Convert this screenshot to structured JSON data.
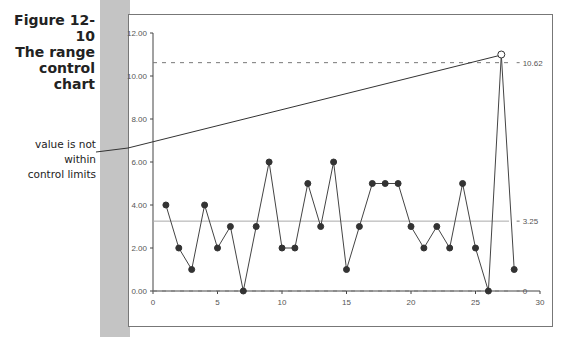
{
  "figure": {
    "caption_line1": "Figure 12-10",
    "caption_line2": "The range",
    "caption_line3": "control",
    "caption_line4": "chart",
    "annotation_line1": "value is not within",
    "annotation_line2": "control limits"
  },
  "chart_data": {
    "type": "line",
    "title": "The range control chart",
    "xlabel": "",
    "ylabel": "",
    "xlim": [
      0,
      30
    ],
    "ylim": [
      0,
      12
    ],
    "x_ticks": [
      "0",
      "5",
      "10",
      "15",
      "20",
      "25",
      "30"
    ],
    "y_ticks": [
      "0.00",
      "2.00",
      "4.00",
      "6.00",
      "8.00",
      "10.00",
      "12.00"
    ],
    "series": [
      {
        "name": "Range",
        "x": [
          1,
          2,
          3,
          4,
          5,
          6,
          7,
          8,
          9,
          10,
          11,
          12,
          13,
          14,
          15,
          16,
          17,
          18,
          19,
          20,
          21,
          22,
          23,
          24,
          25,
          26,
          27,
          28
        ],
        "values": [
          4,
          2,
          1,
          4,
          2,
          3,
          0,
          3,
          6,
          2,
          2,
          5,
          3,
          6,
          1,
          3,
          5,
          5,
          5,
          3,
          2,
          3,
          2,
          5,
          2,
          0,
          11,
          1
        ]
      }
    ],
    "reference_lines": [
      {
        "name": "UCL",
        "value": 10.62,
        "label": "10.62",
        "style": "dashed"
      },
      {
        "name": "Center line",
        "value": 3.25,
        "label": "3.25",
        "style": "solid"
      },
      {
        "name": "LCL",
        "value": 0,
        "label": "0",
        "style": "dashed"
      }
    ],
    "out_of_control_points": [
      {
        "x": 27,
        "value": 11
      }
    ],
    "annotations": [
      "value is not within control limits"
    ],
    "grid": false,
    "legend": "none"
  }
}
